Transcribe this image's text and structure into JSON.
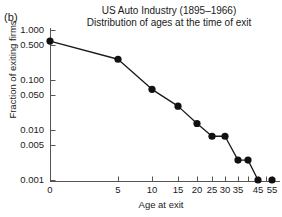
{
  "panel": {
    "label": "(b)"
  },
  "title": {
    "line1": "US Auto Industry (1895–1966)",
    "line2": "Distribution of ages at the time of exit"
  },
  "axes": {
    "xlabel": "Age at exit",
    "ylabel": "Fraction of exiting firms",
    "y_tick_labels": [
      "1.000",
      "0.500",
      "0.100",
      "0.050",
      "0.010",
      "0.005",
      "0.001"
    ],
    "x_tick_labels": [
      "0",
      "5",
      "10",
      "15",
      "20",
      "25",
      "30",
      "35",
      "45",
      "55"
    ]
  },
  "style": {
    "line_color": "#1a1a1a",
    "marker_color": "#111111",
    "axis_color": "#555555",
    "background": "#ffffff"
  },
  "chart_data": {
    "type": "line",
    "xlabel": "Age at exit",
    "ylabel": "Fraction of exiting firms",
    "yscale": "log",
    "ylim": [
      0.001,
      1.0
    ],
    "xlim": [
      0,
      57
    ],
    "grid": false,
    "legend": null,
    "y_ticks": [
      1.0,
      0.5,
      0.1,
      0.05,
      0.01,
      0.005,
      0.001
    ],
    "y_tick_labels": [
      "1.000",
      "0.500",
      "0.100",
      "0.050",
      "0.010",
      "0.005",
      "0.001"
    ],
    "x_ticks": [
      0,
      5,
      10,
      15,
      20,
      25,
      30,
      35,
      40,
      45,
      50,
      55
    ],
    "x_tick_labels": [
      "0",
      "5",
      "10",
      "15",
      "20",
      "25",
      "30",
      "35",
      "",
      "45",
      "",
      "55"
    ],
    "x_axis_note": "tick spacing is visually compressed toward the right edge",
    "x": [
      0,
      5,
      10,
      15,
      20,
      25,
      30,
      35,
      40,
      45,
      55
    ],
    "y": [
      0.6,
      0.26,
      0.065,
      0.03,
      0.0135,
      0.0075,
      0.0075,
      0.0025,
      0.0025,
      0.001,
      0.001
    ],
    "points": [
      {
        "age": 0,
        "fraction": 0.6
      },
      {
        "age": 5,
        "fraction": 0.26
      },
      {
        "age": 10,
        "fraction": 0.065
      },
      {
        "age": 15,
        "fraction": 0.03
      },
      {
        "age": 20,
        "fraction": 0.0135
      },
      {
        "age": 25,
        "fraction": 0.0075
      },
      {
        "age": 30,
        "fraction": 0.0075
      },
      {
        "age": 35,
        "fraction": 0.0025
      },
      {
        "age": 40,
        "fraction": 0.0025
      },
      {
        "age": 45,
        "fraction": 0.001
      },
      {
        "age": 55,
        "fraction": 0.001
      }
    ],
    "last_point_connected": false
  },
  "_geom": {
    "x_px": [
      50,
      118,
      152,
      178,
      197,
      212,
      225,
      238,
      248,
      258,
      266,
      272
    ],
    "y_px": {
      "p1_000": 30,
      "p0_500": 45,
      "p0_100": 80,
      "p0_050": 95,
      "p0_010": 130,
      "p0_005": 145,
      "p0_001": 180
    },
    "data_px": [
      [
        50,
        43
      ],
      [
        118,
        60
      ],
      [
        152,
        90
      ],
      [
        178,
        107
      ],
      [
        197,
        126
      ],
      [
        212,
        138
      ],
      [
        225,
        138
      ],
      [
        238,
        163
      ],
      [
        248,
        163
      ],
      [
        258,
        181
      ],
      [
        272,
        181
      ]
    ]
  }
}
